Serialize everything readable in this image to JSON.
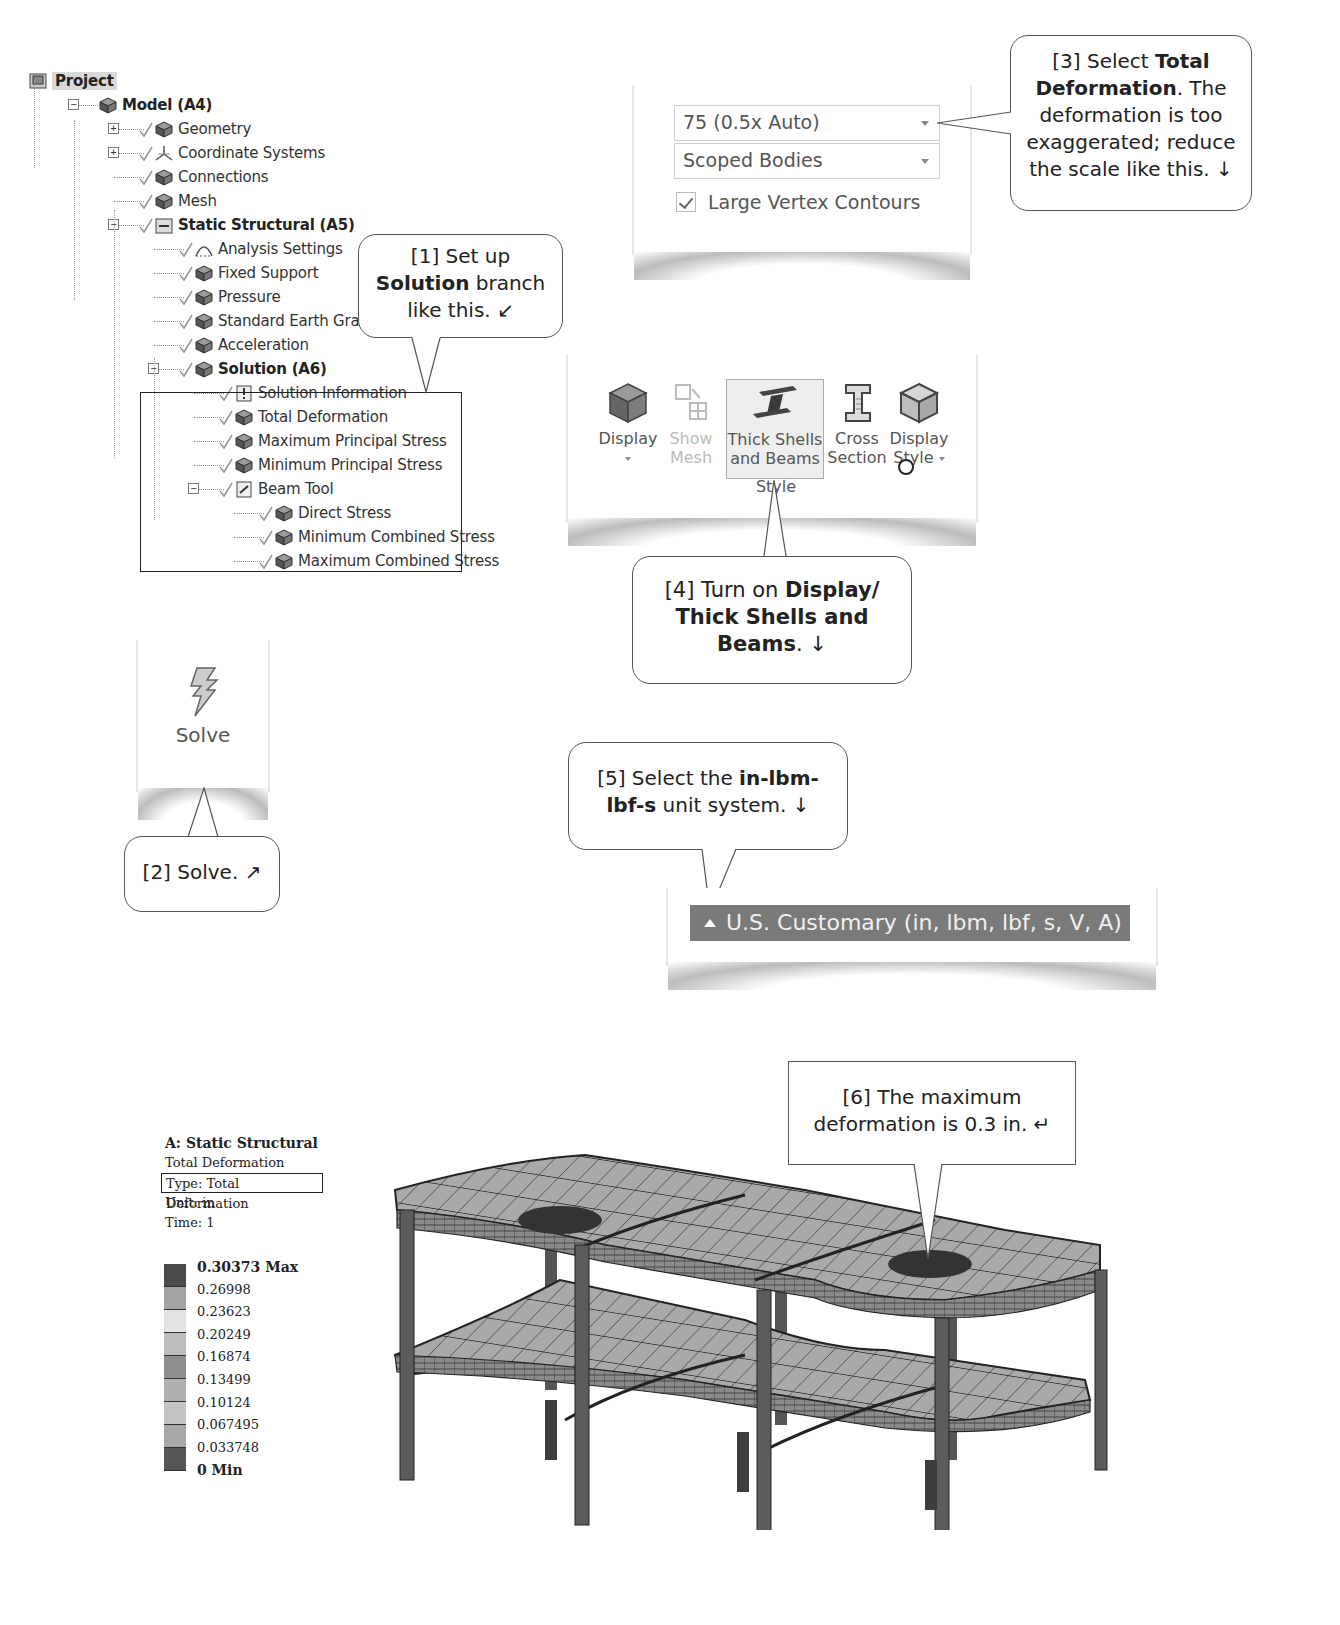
{
  "tree": {
    "items": [
      {
        "label": "Project",
        "level": 0,
        "bold": true,
        "icon": "project-icon"
      },
      {
        "label": "Model (A4)",
        "level": 1,
        "bold": true,
        "icon": "model-icon"
      },
      {
        "label": "Geometry",
        "level": 2,
        "icon": "geometry-icon"
      },
      {
        "label": "Coordinate Systems",
        "level": 2,
        "icon": "coordinate-systems-icon"
      },
      {
        "label": "Connections",
        "level": 2,
        "icon": "connections-icon"
      },
      {
        "label": "Mesh",
        "level": 2,
        "icon": "mesh-icon"
      },
      {
        "label": "Static Structural (A5)",
        "level": 2,
        "bold": true,
        "icon": "static-structural-icon"
      },
      {
        "label": "Analysis Settings",
        "level": 3,
        "icon": "analysis-settings-icon"
      },
      {
        "label": "Fixed Support",
        "level": 3,
        "icon": "fixed-support-icon"
      },
      {
        "label": "Pressure",
        "level": 3,
        "icon": "pressure-icon"
      },
      {
        "label": "Standard Earth Gravity",
        "level": 3,
        "icon": "gravity-icon"
      },
      {
        "label": "Acceleration",
        "level": 3,
        "icon": "acceleration-icon"
      },
      {
        "label": "Solution (A6)",
        "level": 3,
        "bold": true,
        "icon": "solution-icon"
      },
      {
        "label": "Solution Information",
        "level": 4,
        "icon": "solution-information-icon"
      },
      {
        "label": "Total Deformation",
        "level": 4,
        "icon": "result-icon"
      },
      {
        "label": "Maximum Principal Stress",
        "level": 4,
        "icon": "result-icon"
      },
      {
        "label": "Minimum Principal Stress",
        "level": 4,
        "icon": "result-icon"
      },
      {
        "label": "Beam Tool",
        "level": 4,
        "icon": "beam-tool-icon"
      },
      {
        "label": "Direct Stress",
        "level": 5,
        "icon": "result-icon"
      },
      {
        "label": "Minimum Combined Stress",
        "level": 5,
        "icon": "result-icon"
      },
      {
        "label": "Maximum Combined Stress",
        "level": 5,
        "icon": "result-icon"
      }
    ]
  },
  "callouts": {
    "c1": {
      "pre": "[1] Set up ",
      "bold": "Solution",
      "post": " branch like this. ",
      "arrow": "↙"
    },
    "c2": {
      "pre": "[2] Solve. ",
      "arrow": "↗"
    },
    "c3": {
      "pre": "[3] Select ",
      "bold": "Total Deformation",
      "post": ". The deformation is too exaggerated; reduce the scale like this. ",
      "arrow": "↓"
    },
    "c4": {
      "pre": "[4] Turn on ",
      "bold": "Display/ Thick Shells and Beams",
      "post": ". ",
      "arrow": "↓"
    },
    "c5": {
      "pre": "[5] Select the ",
      "bold": "in-lbm-lbf-s",
      "post": " unit system. ",
      "arrow": "↓"
    },
    "c6": {
      "pre": "[6] The maximum deformation is 0.3 in. ",
      "arrow": "↵"
    }
  },
  "scale_panel": {
    "scale_value": "75 (0.5x Auto)",
    "scope_value": "Scoped Bodies",
    "checkbox_label": "Large Vertex Contours",
    "checkbox_checked": true
  },
  "ribbon": {
    "display": "Display",
    "show_mesh_1": "Show",
    "show_mesh_2": "Mesh",
    "thick_1": "Thick Shells",
    "thick_2": "and Beams",
    "cross_1": "Cross",
    "cross_2": "Section",
    "dstyle_1": "Display",
    "dstyle_2": "Style",
    "group_label": "Style"
  },
  "solve": {
    "label": "Solve"
  },
  "unit_system": {
    "label": "U.S. Customary (in, lbm, lbf, s, V, A)"
  },
  "legend": {
    "title": "A: Static Structural",
    "result_name": "Total Deformation",
    "type": "Type: Total Deformation",
    "unit": "Unit: in",
    "time": "Time: 1",
    "max_label": "0.30373 Max",
    "values": [
      "0.26998",
      "0.23623",
      "0.20249",
      "0.16874",
      "0.13499",
      "0.10124",
      "0.067495",
      "0.033748"
    ],
    "min_label": "0 Min",
    "colors": [
      "#4a4a4a",
      "#a3a3a3",
      "#e3e3e3",
      "#bdbdbd",
      "#8e8e8e",
      "#b0b0b0",
      "#c4c4c4",
      "#a8a8a8",
      "#555555"
    ]
  }
}
